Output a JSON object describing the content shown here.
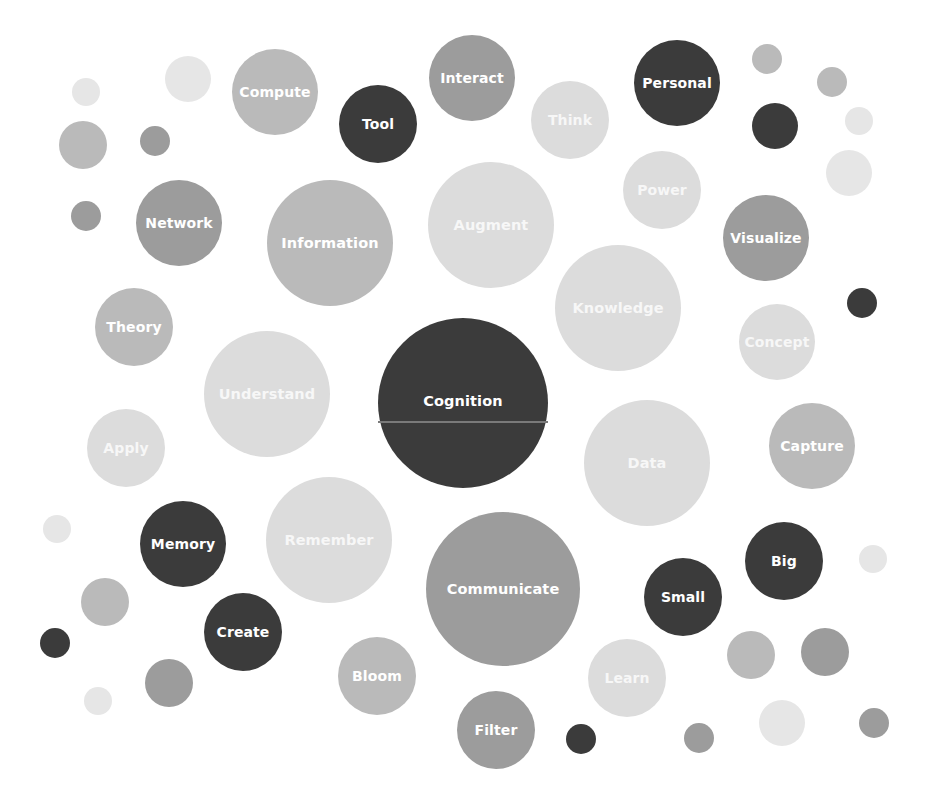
{
  "colors": {
    "dark": "#3b3b3b",
    "middark": "#9c9c9c",
    "mid": "#bababa",
    "light": "#dcdcdc",
    "xlight": "#e6e6e6",
    "background": "#ffffff",
    "label": "#ffffff"
  },
  "bubbles": [
    {
      "label": "Cognition",
      "cx": 463,
      "cy": 403,
      "r": 85,
      "tone": "dark",
      "divider": true
    },
    {
      "label": "Compute",
      "cx": 275,
      "cy": 92,
      "r": 43,
      "tone": "mid"
    },
    {
      "label": "Tool",
      "cx": 378,
      "cy": 124,
      "r": 39,
      "tone": "dark"
    },
    {
      "label": "Interact",
      "cx": 472,
      "cy": 78,
      "r": 43,
      "tone": "middark"
    },
    {
      "label": "Think",
      "cx": 570,
      "cy": 120,
      "r": 39,
      "tone": "light"
    },
    {
      "label": "Personal",
      "cx": 677,
      "cy": 83,
      "r": 43,
      "tone": "dark"
    },
    {
      "label": "Network",
      "cx": 179,
      "cy": 223,
      "r": 43,
      "tone": "middark"
    },
    {
      "label": "Information",
      "cx": 330,
      "cy": 243,
      "r": 63,
      "tone": "mid"
    },
    {
      "label": "Augment",
      "cx": 491,
      "cy": 225,
      "r": 63,
      "tone": "light"
    },
    {
      "label": "Power",
      "cx": 662,
      "cy": 190,
      "r": 39,
      "tone": "light"
    },
    {
      "label": "Visualize",
      "cx": 766,
      "cy": 238,
      "r": 43,
      "tone": "middark"
    },
    {
      "label": "Knowledge",
      "cx": 618,
      "cy": 308,
      "r": 63,
      "tone": "light"
    },
    {
      "label": "Theory",
      "cx": 134,
      "cy": 327,
      "r": 39,
      "tone": "mid"
    },
    {
      "label": "Concept",
      "cx": 777,
      "cy": 342,
      "r": 38,
      "tone": "light"
    },
    {
      "label": "Understand",
      "cx": 267,
      "cy": 394,
      "r": 63,
      "tone": "light"
    },
    {
      "label": "Apply",
      "cx": 126,
      "cy": 448,
      "r": 39,
      "tone": "light"
    },
    {
      "label": "Data",
      "cx": 647,
      "cy": 463,
      "r": 63,
      "tone": "light"
    },
    {
      "label": "Capture",
      "cx": 812,
      "cy": 446,
      "r": 43,
      "tone": "mid"
    },
    {
      "label": "Memory",
      "cx": 183,
      "cy": 544,
      "r": 43,
      "tone": "dark"
    },
    {
      "label": "Remember",
      "cx": 329,
      "cy": 540,
      "r": 63,
      "tone": "light"
    },
    {
      "label": "Communicate",
      "cx": 503,
      "cy": 589,
      "r": 77,
      "tone": "middark"
    },
    {
      "label": "Big",
      "cx": 784,
      "cy": 561,
      "r": 39,
      "tone": "dark"
    },
    {
      "label": "Small",
      "cx": 683,
      "cy": 597,
      "r": 39,
      "tone": "dark"
    },
    {
      "label": "Create",
      "cx": 243,
      "cy": 632,
      "r": 39,
      "tone": "dark"
    },
    {
      "label": "Bloom",
      "cx": 377,
      "cy": 676,
      "r": 39,
      "tone": "mid"
    },
    {
      "label": "Learn",
      "cx": 627,
      "cy": 678,
      "r": 39,
      "tone": "light"
    },
    {
      "label": "Filter",
      "cx": 496,
      "cy": 730,
      "r": 39,
      "tone": "middark"
    }
  ],
  "dots": [
    {
      "cx": 86,
      "cy": 92,
      "r": 14,
      "tone": "xlight"
    },
    {
      "cx": 188,
      "cy": 79,
      "r": 23,
      "tone": "xlight"
    },
    {
      "cx": 83,
      "cy": 145,
      "r": 24,
      "tone": "mid"
    },
    {
      "cx": 155,
      "cy": 141,
      "r": 15,
      "tone": "middark"
    },
    {
      "cx": 86,
      "cy": 216,
      "r": 15,
      "tone": "middark"
    },
    {
      "cx": 767,
      "cy": 59,
      "r": 15,
      "tone": "mid"
    },
    {
      "cx": 832,
      "cy": 82,
      "r": 15,
      "tone": "mid"
    },
    {
      "cx": 775,
      "cy": 126,
      "r": 23,
      "tone": "dark"
    },
    {
      "cx": 859,
      "cy": 121,
      "r": 14,
      "tone": "xlight"
    },
    {
      "cx": 849,
      "cy": 173,
      "r": 23,
      "tone": "xlight"
    },
    {
      "cx": 862,
      "cy": 303,
      "r": 15,
      "tone": "dark"
    },
    {
      "cx": 57,
      "cy": 529,
      "r": 14,
      "tone": "xlight"
    },
    {
      "cx": 105,
      "cy": 602,
      "r": 24,
      "tone": "mid"
    },
    {
      "cx": 55,
      "cy": 643,
      "r": 15,
      "tone": "dark"
    },
    {
      "cx": 169,
      "cy": 683,
      "r": 24,
      "tone": "middark"
    },
    {
      "cx": 98,
      "cy": 701,
      "r": 14,
      "tone": "xlight"
    },
    {
      "cx": 873,
      "cy": 559,
      "r": 14,
      "tone": "xlight"
    },
    {
      "cx": 751,
      "cy": 655,
      "r": 24,
      "tone": "mid"
    },
    {
      "cx": 825,
      "cy": 652,
      "r": 24,
      "tone": "middark"
    },
    {
      "cx": 581,
      "cy": 739,
      "r": 15,
      "tone": "dark"
    },
    {
      "cx": 699,
      "cy": 738,
      "r": 15,
      "tone": "middark"
    },
    {
      "cx": 782,
      "cy": 723,
      "r": 23,
      "tone": "xlight"
    },
    {
      "cx": 874,
      "cy": 723,
      "r": 15,
      "tone": "middark"
    }
  ]
}
